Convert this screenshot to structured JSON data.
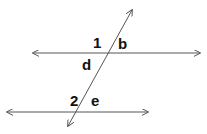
{
  "diagram": {
    "stroke_color": "#555555",
    "label_color": "#111111",
    "lines": [
      {
        "name": "upper-parallel-line",
        "x1": 33,
        "y1": 53,
        "x2": 200,
        "y2": 53
      },
      {
        "name": "lower-parallel-line",
        "x1": 7,
        "y1": 112,
        "x2": 148,
        "y2": 112
      },
      {
        "name": "transversal-line",
        "x1": 132,
        "y1": 10,
        "x2": 68,
        "y2": 126
      }
    ],
    "labels": {
      "angle_1": "1",
      "angle_b": "b",
      "angle_d": "d",
      "angle_2": "2",
      "angle_e": "e"
    }
  }
}
